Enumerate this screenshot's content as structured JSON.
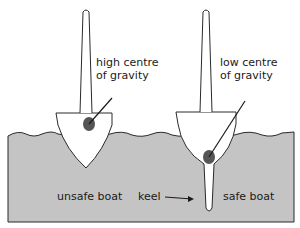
{
  "diagram": {
    "labels": {
      "high_cg_line1": "high centre",
      "high_cg_line2": "of gravity",
      "low_cg_line1": "low centre",
      "low_cg_line2": "of gravity",
      "unsafe": "unsafe boat",
      "keel": "keel",
      "safe": "safe boat"
    },
    "colors": {
      "water": "#c4c4c4",
      "outline": "#2a2a2a",
      "cg_dot": "#555555",
      "hull": "#ffffff"
    }
  }
}
